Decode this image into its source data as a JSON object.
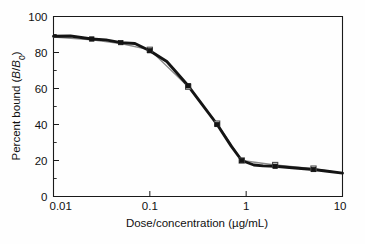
{
  "chart_data": {
    "type": "line",
    "title": "",
    "xlabel": "Dose/concentration (µg/mL)",
    "ylabel": "Percent bound (B/B₀)",
    "ylabel_parts": {
      "prefix": "Percent bound (",
      "b_italic": "B",
      "slash": "/",
      "b0_italic": "B",
      "b0_sub": "0",
      "suffix": ")"
    },
    "xscale": "log",
    "yscale": "linear",
    "xlim": [
      0.01,
      10
    ],
    "ylim": [
      0,
      100
    ],
    "grid": false,
    "legend": "none",
    "x_tick_labels": [
      "0.01",
      "0.1",
      "1",
      "10"
    ],
    "x_tick_values": [
      0.01,
      0.1,
      1,
      10
    ],
    "y_tick_labels": [
      "0",
      "20",
      "40",
      "60",
      "80",
      "100"
    ],
    "y_tick_values": [
      0,
      20,
      40,
      60,
      80,
      100
    ],
    "y_minor_ticks": [
      10,
      30,
      50,
      70,
      90
    ],
    "series": [
      {
        "name": "observed",
        "marker": "filled-square",
        "color": "#141414",
        "linewidth": 2.9,
        "x": [
          0.01,
          0.015,
          0.025,
          0.035,
          0.05,
          0.07,
          0.1,
          0.15,
          0.175,
          0.25,
          0.35,
          0.5,
          0.7,
          0.9,
          1.2,
          1.5,
          2.0,
          3.0,
          5.0,
          7.0,
          10.0
        ],
        "values": [
          89.0,
          89.2,
          87.5,
          87.0,
          85.5,
          85.0,
          81.0,
          75.0,
          71.0,
          61.5,
          51.0,
          40.0,
          28.0,
          20.0,
          17.5,
          17.0,
          16.8,
          16.0,
          15.0,
          14.0,
          13.0
        ]
      },
      {
        "name": "fitted",
        "marker": "open-square",
        "color": "#8a8a8a",
        "linewidth": 1.3,
        "x": [
          0.01,
          0.025,
          0.05,
          0.1,
          0.25,
          0.5,
          0.9,
          2.0,
          5.0,
          10.0
        ],
        "values": [
          88.5,
          87.0,
          85.0,
          81.5,
          61.0,
          40.5,
          20.0,
          17.5,
          15.5,
          13.0
        ]
      }
    ],
    "markers_filled": [
      {
        "x": 0.025,
        "y": 87.5
      },
      {
        "x": 0.05,
        "y": 85.5
      },
      {
        "x": 0.1,
        "y": 81.0
      },
      {
        "x": 0.25,
        "y": 61.5
      },
      {
        "x": 0.5,
        "y": 40.0
      },
      {
        "x": 0.9,
        "y": 20.0
      },
      {
        "x": 2.0,
        "y": 16.8
      },
      {
        "x": 5.0,
        "y": 15.0
      }
    ],
    "markers_open": [
      {
        "x": 0.1,
        "y": 81.5
      },
      {
        "x": 0.25,
        "y": 61.0
      },
      {
        "x": 0.5,
        "y": 40.5
      },
      {
        "x": 0.9,
        "y": 20.0
      },
      {
        "x": 2.0,
        "y": 17.5
      },
      {
        "x": 5.0,
        "y": 15.5
      }
    ]
  },
  "axes": {
    "x_title": "Dose/concentration (µg/mL)",
    "y_title_prefix": "Percent bound (",
    "y_title_b": "B",
    "y_title_slash": "/",
    "y_title_b0": "B",
    "y_title_sub": "0",
    "y_title_suffix": ")"
  },
  "colors": {
    "series_primary": "#141414",
    "series_secondary": "#8a8a8a",
    "axis": "#1a1a1a",
    "background": "#fefefe"
  }
}
